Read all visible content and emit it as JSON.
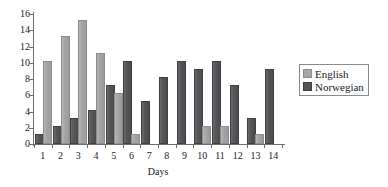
{
  "chart_data": {
    "type": "bar",
    "title": "",
    "xlabel": "Days",
    "ylabel": "",
    "categories": [
      "1",
      "2",
      "3",
      "4",
      "5",
      "6",
      "7",
      "8",
      "9",
      "10",
      "11",
      "12",
      "13",
      "14"
    ],
    "ylim": [
      0,
      16
    ],
    "yticks": [
      "0",
      "2",
      "4",
      "6",
      "8",
      "10",
      "12",
      "14",
      "16"
    ],
    "grid": false,
    "legend_position": "right",
    "series": [
      {
        "name": "English",
        "color": "#a8a8a8",
        "values": [
          10,
          13,
          15,
          11,
          6,
          1,
          0,
          0,
          0,
          2,
          2,
          0,
          1,
          0
        ]
      },
      {
        "name": "Norwegian",
        "color": "#555559",
        "values": [
          1,
          2,
          3,
          4,
          7,
          10,
          5,
          8,
          10,
          9,
          10,
          7,
          3,
          9
        ]
      }
    ]
  },
  "legend": {
    "entries": [
      {
        "label": "English"
      },
      {
        "label": "Norwegian"
      }
    ]
  }
}
